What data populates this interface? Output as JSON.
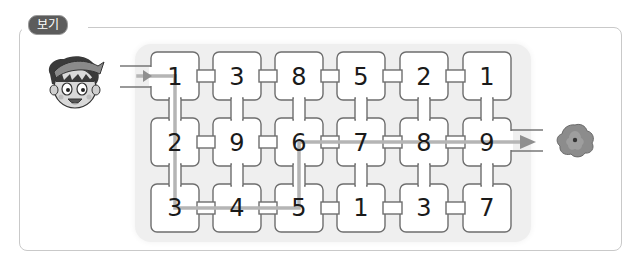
{
  "label": {
    "text": "보기"
  },
  "maze": {
    "columns": 6,
    "rows": 3,
    "grid": [
      [
        "1",
        "3",
        "8",
        "5",
        "2",
        "1"
      ],
      [
        "2",
        "9",
        "6",
        "7",
        "8",
        "9"
      ],
      [
        "3",
        "4",
        "5",
        "1",
        "3",
        "7"
      ]
    ],
    "cells": [
      {
        "row": 0,
        "col": 0,
        "value": "1"
      },
      {
        "row": 0,
        "col": 1,
        "value": "3"
      },
      {
        "row": 0,
        "col": 2,
        "value": "8"
      },
      {
        "row": 0,
        "col": 3,
        "value": "5"
      },
      {
        "row": 0,
        "col": 4,
        "value": "2"
      },
      {
        "row": 0,
        "col": 5,
        "value": "1"
      },
      {
        "row": 1,
        "col": 0,
        "value": "2"
      },
      {
        "row": 1,
        "col": 1,
        "value": "9"
      },
      {
        "row": 1,
        "col": 2,
        "value": "6"
      },
      {
        "row": 1,
        "col": 3,
        "value": "7"
      },
      {
        "row": 1,
        "col": 4,
        "value": "8"
      },
      {
        "row": 1,
        "col": 5,
        "value": "9"
      },
      {
        "row": 2,
        "col": 0,
        "value": "3"
      },
      {
        "row": 2,
        "col": 1,
        "value": "4"
      },
      {
        "row": 2,
        "col": 2,
        "value": "5"
      },
      {
        "row": 2,
        "col": 3,
        "value": "1"
      },
      {
        "row": 2,
        "col": 4,
        "value": "3"
      },
      {
        "row": 2,
        "col": 5,
        "value": "7"
      }
    ],
    "solution_path": [
      "1",
      "2",
      "3",
      "4",
      "5",
      "6",
      "7",
      "8",
      "9"
    ],
    "start_icon": "boy-character-icon",
    "end_icon": "flower-icon"
  },
  "colors": {
    "frame_border": "#c9c9c9",
    "badge_bg": "#5c5c5c",
    "panel_bg": "#efefef",
    "wall": "#6e6e6e",
    "path": "#b5b5b5",
    "arrow": "#8f8f8f"
  },
  "n": {
    "c0": "1",
    "c1": "3",
    "c2": "8",
    "c3": "5",
    "c4": "2",
    "c5": "1",
    "c6": "2",
    "c7": "9",
    "c8": "6",
    "c9": "7",
    "c10": "8",
    "c11": "9",
    "c12": "3",
    "c13": "4",
    "c14": "5",
    "c15": "1",
    "c16": "3",
    "c17": "7"
  }
}
